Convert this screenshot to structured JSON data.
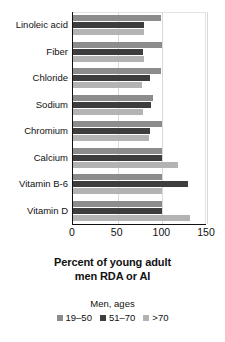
{
  "chart_data": {
    "type": "bar",
    "orientation": "horizontal",
    "title": "",
    "xlabel": "Percent of young adult men RDA or AI",
    "ylabel": "",
    "xlim": [
      0,
      150
    ],
    "xticks": [
      0,
      50,
      100,
      150
    ],
    "xtick_labels": [
      "0",
      "50",
      "100",
      "150"
    ],
    "grid": true,
    "grid_axis": "x",
    "legend_position": "bottom",
    "legend_title": "Men, ages",
    "categories": [
      "Linoleic acid",
      "Fiber",
      "Chloride",
      "Sodium",
      "Chromium",
      "Calcium",
      "Vitamin B-6",
      "Vitamin D"
    ],
    "series": [
      {
        "name": "19-50",
        "color": "#8c8c8c",
        "values": [
          98,
          100,
          98,
          90,
          100,
          100,
          100,
          100
        ]
      },
      {
        "name": "51-70",
        "color": "#3d3d3d",
        "values": [
          80,
          78,
          86,
          87,
          86,
          100,
          129,
          100
        ]
      },
      {
        "name": ">70",
        "color": "#b3b3b3",
        "values": [
          80,
          80,
          77,
          78,
          85,
          118,
          100,
          131
        ]
      }
    ]
  },
  "axis_title": {
    "line1": "Percent of young adult",
    "line2": "men RDA or AI"
  },
  "legend": {
    "title": "Men, ages",
    "items": [
      {
        "label": "19–50",
        "color": "#8c8c8c"
      },
      {
        "label": "51–70",
        "color": "#3d3d3d"
      },
      {
        "label": ">70",
        "color": "#b3b3b3"
      }
    ]
  },
  "colors": {
    "axis": "#111111",
    "grid": "#d9d9d9",
    "background": "#ffffff"
  }
}
